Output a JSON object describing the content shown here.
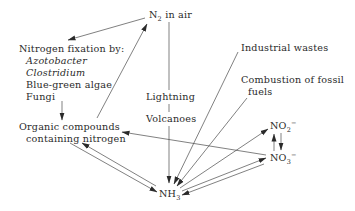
{
  "diagram": {
    "nodes": {
      "n2_air": {
        "text": "N",
        "sub": "2",
        "suffix": " in air"
      },
      "fixation_title": "Nitrogen fixation by:",
      "fixers": [
        "Azotobacter",
        "Clostridium",
        "Blue-green algae",
        "Fungi"
      ],
      "organic_line1": "Organic compounds",
      "organic_line2": "containing nitrogen",
      "lightning": "Lightning",
      "volcanoes": "Volcanoes",
      "industrial": "Industrial wastes",
      "combustion_line1": "Combustion of fossil",
      "combustion_line2": "fuels",
      "nh3": {
        "text": "NH",
        "sub": "3"
      },
      "no2": {
        "text": "NO",
        "sub": "2",
        "sup": "−"
      },
      "no3": {
        "text": "NO",
        "sub": "3",
        "sup": "−"
      }
    },
    "edges": [
      {
        "from": "N2 in air",
        "to": "Nitrogen fixation"
      },
      {
        "from": "Fungi / fixation",
        "to": "Organic compounds"
      },
      {
        "from": "Organic compounds",
        "to": "N2 in air"
      },
      {
        "from": "N2 in air",
        "to": "NH3",
        "via": [
          "Lightning",
          "Volcanoes"
        ]
      },
      {
        "from": "Industrial wastes",
        "to": "NH3"
      },
      {
        "from": "Combustion of fossil fuels",
        "to": "NH3"
      },
      {
        "from": "Organic compounds",
        "to": "NH3"
      },
      {
        "from": "NH3",
        "to": "Organic compounds"
      },
      {
        "from": "NO3-",
        "to": "Organic compounds"
      },
      {
        "from": "NH3",
        "to": "NO2-"
      },
      {
        "from": "NH3",
        "to": "NO3-"
      },
      {
        "from": "NO3-",
        "to": "NH3"
      },
      {
        "from": "NO2-",
        "to": "NO3-"
      },
      {
        "from": "NO3-",
        "to": "NO2-"
      }
    ],
    "colors": {
      "line": "#3a3a3a",
      "text": "#2a2a2a",
      "background": "#ffffff"
    }
  }
}
